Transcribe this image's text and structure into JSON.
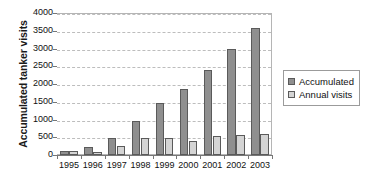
{
  "chart_data": {
    "type": "bar",
    "title": "",
    "subtitle": "",
    "xlabel": "",
    "ylabel": "Accumulated tanker visits",
    "categories": [
      "1995",
      "1996",
      "1997",
      "1998",
      "1999",
      "2000",
      "2001",
      "2002",
      "2003"
    ],
    "series": [
      {
        "name": "Accumulated",
        "color": "#8f8f8f",
        "values": [
          120,
          230,
          490,
          970,
          1460,
          1850,
          2395,
          2985,
          3580
        ]
      },
      {
        "name": "Annual visits",
        "color": "#d4d4d4",
        "values": [
          120,
          95,
          265,
          480,
          490,
          400,
          540,
          575,
          590
        ]
      }
    ],
    "ylim": [
      0,
      4000
    ],
    "ytick_labels": [
      "4000",
      "3500",
      "3000",
      "2500",
      "2000",
      "1500",
      "1000",
      "500",
      "0"
    ],
    "ytick_values": [
      4000,
      3500,
      3000,
      2500,
      2000,
      1500,
      1000,
      500,
      0
    ],
    "grid": true,
    "grid_axis": "y",
    "grid_style": "dashed",
    "legend_position": "right",
    "legend": [
      "Accumulated",
      "Annual visits"
    ]
  },
  "legend": {
    "items": [
      {
        "label": "Accumulated",
        "swatch": "accumulated-swatch"
      },
      {
        "label": "Annual visits",
        "swatch": "annual-visits-swatch"
      }
    ]
  }
}
